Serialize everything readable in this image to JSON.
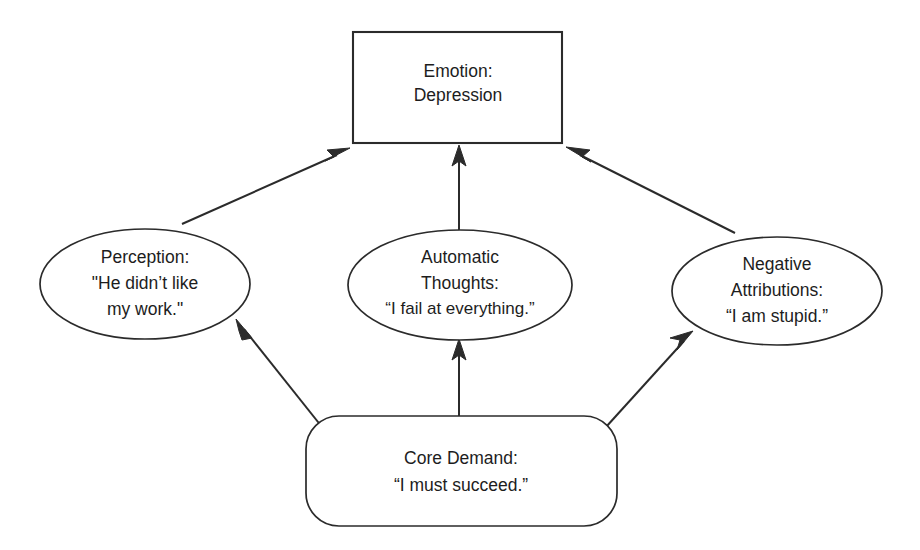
{
  "diagram": {
    "background_color": "#ffffff",
    "line_color": "#2b2b2b",
    "text_color": "#1d1d1d",
    "nodes": [
      {
        "id": "emotion",
        "shape": "rectangle",
        "lines": [
          "Emotion:",
          "Depression"
        ],
        "line1": "Emotion:",
        "line2": "Depression",
        "line3": ""
      },
      {
        "id": "perception",
        "shape": "ellipse",
        "lines": [
          "Perception:",
          "\"He didn't like",
          "my work.\""
        ],
        "line1": "Perception:",
        "line2": "\"He didn’t like",
        "line3": "my work.\""
      },
      {
        "id": "automatic-thoughts",
        "shape": "ellipse",
        "lines": [
          "Automatic",
          "Thoughts:",
          "“I fail at everything.”"
        ],
        "line1": "Automatic",
        "line2": "Thoughts:",
        "line3": "“I fail at everything.”"
      },
      {
        "id": "negative-attributions",
        "shape": "ellipse",
        "lines": [
          "Negative",
          "Attributions:",
          "“I am stupid.”"
        ],
        "line1": "Negative",
        "line2": "Attributions:",
        "line3": "“I am stupid.”"
      },
      {
        "id": "core-demand",
        "shape": "rounded-rectangle",
        "lines": [
          "Core Demand:",
          "“I must succeed.”"
        ],
        "line1": "Core Demand:",
        "line2": "“I must succeed.”",
        "line3": ""
      }
    ],
    "edges": [
      {
        "id": "core-to-perception",
        "from": "core-demand",
        "to": "perception",
        "style": "arrow"
      },
      {
        "id": "core-to-automatic-thoughts",
        "from": "core-demand",
        "to": "automatic-thoughts",
        "style": "arrow"
      },
      {
        "id": "core-to-negative-attributions",
        "from": "core-demand",
        "to": "negative-attributions",
        "style": "arrow"
      },
      {
        "id": "perception-to-emotion",
        "from": "perception",
        "to": "emotion",
        "style": "arrow"
      },
      {
        "id": "automatic-thoughts-to-emotion",
        "from": "automatic-thoughts",
        "to": "emotion",
        "style": "arrow"
      },
      {
        "id": "negative-attributions-to-emotion",
        "from": "negative-attributions",
        "to": "emotion",
        "style": "arrow"
      }
    ]
  }
}
